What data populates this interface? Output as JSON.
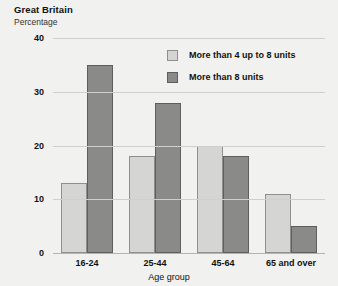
{
  "chart_data": {
    "type": "bar",
    "title": "Great Britain",
    "subtitle": "Percentage",
    "xlabel": "Age group",
    "ylabel": "",
    "categories": [
      "16-24",
      "25-44",
      "45-64",
      "65 and over"
    ],
    "series": [
      {
        "name": "More than 4 up to 8 units",
        "color": "#d5d5d3",
        "values": [
          13,
          18,
          20,
          11
        ]
      },
      {
        "name": "More than 8 units",
        "color": "#8a8a88",
        "values": [
          35,
          28,
          18,
          5
        ]
      }
    ],
    "yticks": [
      0,
      10,
      20,
      30,
      40
    ],
    "ylim": [
      0,
      40
    ],
    "grid": true,
    "legend_position": "top-right"
  },
  "colors": {
    "background": "#f1f1ef",
    "gridline": "#cfcfcd",
    "axis": "#b4b4b2",
    "text": "#111111",
    "series_light_fill": "#d5d5d3",
    "series_light_border": "#8f8f8d",
    "series_dark_fill": "#8a8a88",
    "series_dark_border": "#5e5e5c"
  }
}
